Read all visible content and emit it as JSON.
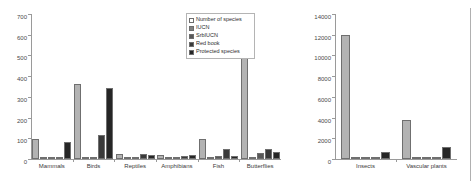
{
  "chart_data": [
    {
      "type": "bar",
      "title": "",
      "panel": "left",
      "xlabel": "",
      "ylabel": "",
      "ylim": [
        0,
        700
      ],
      "yticks": [
        0,
        100,
        200,
        300,
        400,
        500,
        600,
        700
      ],
      "grid": false,
      "legend_position": "top-right",
      "categories": [
        "Mammals",
        "Birds",
        "Reptiles",
        "Amphibians",
        "Fish",
        "Butterflies"
      ],
      "series": [
        {
          "name": "Number of species",
          "color": "#b3b3b3",
          "values": [
            95,
            360,
            26,
            19,
            98,
            570
          ]
        },
        {
          "name": "IUCN",
          "color": "#808080",
          "values": [
            3,
            4,
            3,
            2,
            4,
            9
          ]
        },
        {
          "name": "SrbIUCN",
          "color": "#595959",
          "values": [
            8,
            8,
            12,
            12,
            14,
            30
          ]
        },
        {
          "name": "Red book",
          "color": "#3a3a3a",
          "values": [
            4,
            115,
            22,
            16,
            46,
            46
          ]
        },
        {
          "name": "Protected species",
          "color": "#262626",
          "values": [
            80,
            345,
            20,
            20,
            14,
            32
          ]
        }
      ]
    },
    {
      "type": "bar",
      "title": "",
      "panel": "right",
      "xlabel": "",
      "ylabel": "",
      "ylim": [
        0,
        14000
      ],
      "yticks": [
        0,
        2000,
        4000,
        6000,
        8000,
        10000,
        12000,
        14000
      ],
      "grid": false,
      "categories": [
        "Insects",
        "Vascular plants"
      ],
      "series": [
        {
          "name": "Number of species",
          "color": "#b3b3b3",
          "values": [
            12000,
            3800
          ]
        },
        {
          "name": "IUCN",
          "color": "#808080",
          "values": [
            60,
            70
          ]
        },
        {
          "name": "SrbIUCN",
          "color": "#595959",
          "values": [
            150,
            200
          ]
        },
        {
          "name": "Red book",
          "color": "#3a3a3a",
          "values": [
            120,
            180
          ]
        },
        {
          "name": "Protected species",
          "color": "#262626",
          "values": [
            700,
            1150
          ]
        }
      ]
    }
  ],
  "legend": {
    "items": [
      {
        "label": "Number of species",
        "color": "#ffffff"
      },
      {
        "label": "IUCN",
        "color": "#808080"
      },
      {
        "label": "SrbIUCN",
        "color": "#595959"
      },
      {
        "label": "Red book",
        "color": "#3a3a3a"
      },
      {
        "label": "Protected species",
        "color": "#262626"
      }
    ]
  }
}
